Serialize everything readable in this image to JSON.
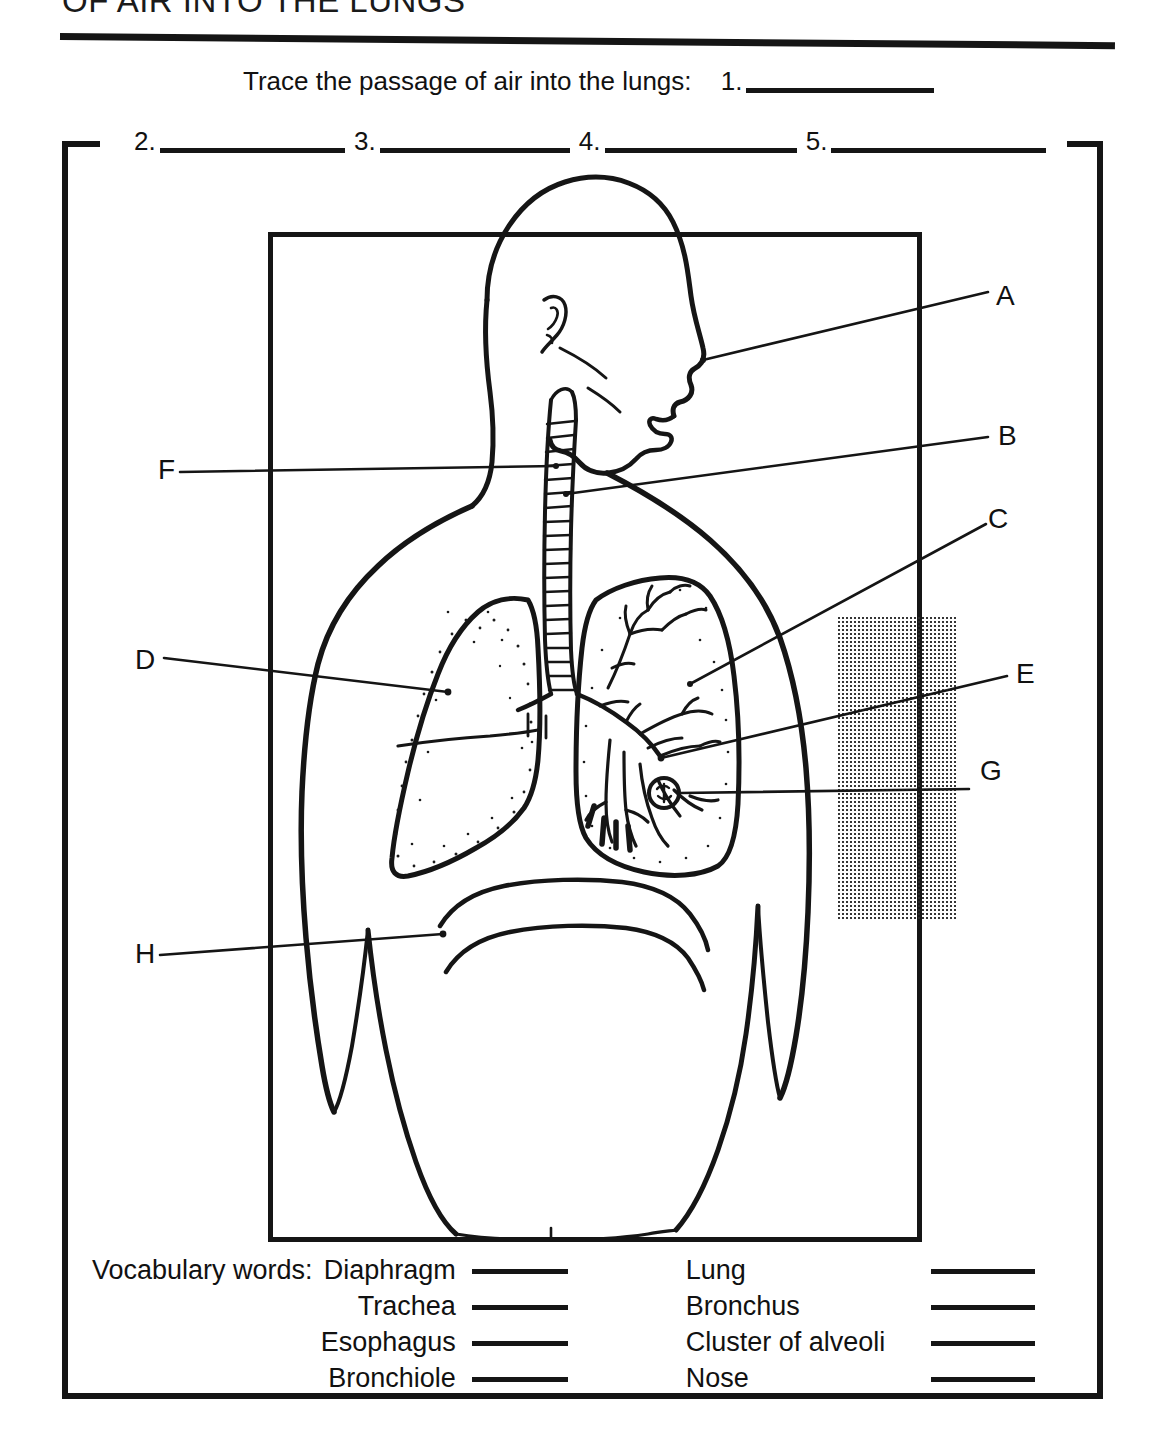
{
  "document": {
    "title": "OF AIR INTO THE LUNGS",
    "trace_prompt": "Trace the passage of air into the lungs:",
    "trace_items": [
      {
        "number": "1."
      },
      {
        "number": "2."
      },
      {
        "number": "3."
      },
      {
        "number": "4."
      },
      {
        "number": "5."
      }
    ]
  },
  "diagram": {
    "labels": [
      {
        "letter": "A",
        "target": "nose"
      },
      {
        "letter": "B",
        "target": "trachea"
      },
      {
        "letter": "C",
        "target": "bronchiole"
      },
      {
        "letter": "D",
        "target": "lung"
      },
      {
        "letter": "E",
        "target": "bronchus"
      },
      {
        "letter": "F",
        "target": "esophagus"
      },
      {
        "letter": "G",
        "target": "cluster-of-alveoli"
      },
      {
        "letter": "H",
        "target": "diaphragm"
      }
    ]
  },
  "vocabulary": {
    "heading": "Vocabulary words:",
    "left_column": [
      "Diaphragm",
      "Trachea",
      "Esophagus",
      "Bronchiole"
    ],
    "right_column": [
      "Lung",
      "Bronchus",
      "Cluster of alveoli",
      "Nose"
    ]
  },
  "colors": {
    "ink": "#151515",
    "paper": "#ffffff"
  }
}
